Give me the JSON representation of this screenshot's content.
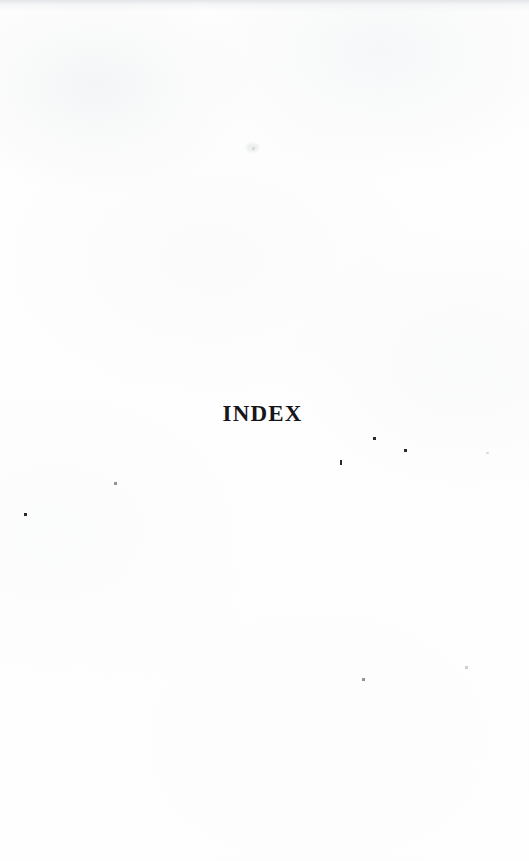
{
  "page": {
    "kind": "scanned-book-divider-page",
    "background_color": "#fefefe",
    "ink_color": "#16161a",
    "width": 529,
    "height": 861
  },
  "content": {
    "section_title": "INDEX"
  },
  "artifacts": {
    "top_edge_band": {
      "height": 11,
      "color": "#e2e4e7"
    },
    "smudge": {
      "x": 246,
      "y": 143,
      "w": 13,
      "h": 9
    },
    "specks": [
      {
        "name": "speck-right-upper",
        "x": 373,
        "y": 437,
        "w": 3,
        "h": 3,
        "tone": "solid"
      },
      {
        "name": "speck-right-mid",
        "x": 404,
        "y": 449,
        "w": 3,
        "h": 3,
        "tone": "solid"
      },
      {
        "name": "speck-center-low",
        "x": 340,
        "y": 460,
        "w": 2,
        "h": 5,
        "tone": "solid"
      },
      {
        "name": "speck-far-right",
        "x": 486,
        "y": 452,
        "w": 3,
        "h": 2,
        "tone": "ghost"
      },
      {
        "name": "speck-left-upper",
        "x": 114,
        "y": 482,
        "w": 3,
        "h": 3,
        "tone": "soft"
      },
      {
        "name": "speck-left-lower",
        "x": 24,
        "y": 513,
        "w": 3,
        "h": 3,
        "tone": "solid"
      },
      {
        "name": "speck-bottom-mid",
        "x": 362,
        "y": 678,
        "w": 3,
        "h": 3,
        "tone": "soft"
      },
      {
        "name": "speck-bottom-right",
        "x": 465,
        "y": 666,
        "w": 3,
        "h": 3,
        "tone": "faint"
      },
      {
        "name": "speck-upper-faint",
        "x": 252,
        "y": 147,
        "w": 3,
        "h": 3,
        "tone": "ghost"
      }
    ]
  }
}
